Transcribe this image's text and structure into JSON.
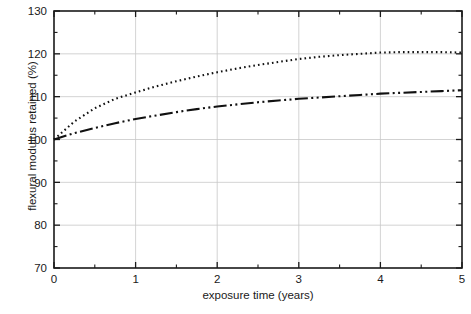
{
  "chart_data": {
    "type": "line",
    "title": "",
    "xlabel": "exposure time (years)",
    "ylabel": "flexural modulus retained (%)",
    "xlim": [
      0,
      5
    ],
    "ylim": [
      70,
      130
    ],
    "xticks": [
      0,
      1,
      2,
      3,
      4,
      5
    ],
    "yticks": [
      70,
      80,
      90,
      100,
      110,
      120,
      130
    ],
    "xtick_labels": [
      "0",
      "1",
      "2",
      "3",
      "4",
      "5"
    ],
    "ytick_labels": [
      "70",
      "80",
      "90",
      "100",
      "110",
      "120",
      "130"
    ],
    "x_minor_step": 0.5,
    "y_minor_step": 5,
    "grid": true,
    "grid_color": "#c8c8c8",
    "legend": null,
    "axis_color": "#1a1a1a",
    "background": "#ffffff",
    "x": [
      0,
      0.25,
      0.5,
      0.75,
      1,
      1.25,
      1.5,
      1.75,
      2,
      2.25,
      2.5,
      2.75,
      3,
      3.25,
      3.5,
      3.75,
      4,
      4.25,
      4.5,
      4.75,
      5
    ],
    "series": [
      {
        "name": "series-dotted",
        "style": "dotted",
        "color": "#111111",
        "line_width": 2.1,
        "dash_pattern": "1.6 3.1",
        "values": [
          100.0,
          104.2,
          107.3,
          109.5,
          111.0,
          112.4,
          113.6,
          114.7,
          115.7,
          116.6,
          117.4,
          118.1,
          118.8,
          119.3,
          119.7,
          120.0,
          120.3,
          120.4,
          120.4,
          120.4,
          120.3
        ]
      },
      {
        "name": "series-dash-dot-dot",
        "style": "dash-dot-dot",
        "color": "#111111",
        "line_width": 2.1,
        "dash_pattern": "13 3.4 2 3.4 2 3.4",
        "values": [
          100.0,
          101.5,
          102.7,
          103.8,
          104.8,
          105.6,
          106.4,
          107.1,
          107.7,
          108.2,
          108.7,
          109.1,
          109.5,
          109.8,
          110.1,
          110.4,
          110.7,
          110.9,
          111.1,
          111.3,
          111.5
        ]
      }
    ]
  },
  "plot_geometry": {
    "left": 54,
    "right": 462,
    "top": 11,
    "bottom": 268
  }
}
